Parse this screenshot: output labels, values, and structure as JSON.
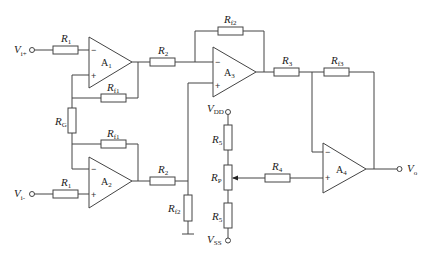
{
  "diagram": {
    "type": "circuit-schematic",
    "inputs": [
      {
        "id": "vin_plus",
        "main": "V",
        "sub": "i+"
      },
      {
        "id": "vin_minus",
        "main": "V",
        "sub": "i-"
      }
    ],
    "output": {
      "main": "V",
      "sub": "o"
    },
    "supplies": [
      {
        "id": "vdd",
        "main": "V",
        "sub": "DD"
      },
      {
        "id": "vss",
        "main": "V",
        "sub": "SS"
      }
    ],
    "amplifiers": [
      {
        "id": "A1",
        "main": "A",
        "sub": "1"
      },
      {
        "id": "A2",
        "main": "A",
        "sub": "2"
      },
      {
        "id": "A3",
        "main": "A",
        "sub": "3"
      },
      {
        "id": "A4",
        "main": "A",
        "sub": "4"
      }
    ],
    "resistors": {
      "r1_top": {
        "main": "R",
        "sub": "1"
      },
      "r1_bot": {
        "main": "R",
        "sub": "1"
      },
      "rf1_top": {
        "main": "R",
        "sub": "f1"
      },
      "rf1_bot": {
        "main": "R",
        "sub": "f1"
      },
      "rg": {
        "main": "R",
        "sub": "G"
      },
      "r2_top": {
        "main": "R",
        "sub": "2"
      },
      "r2_bot": {
        "main": "R",
        "sub": "2"
      },
      "rf2_top": {
        "main": "R",
        "sub": "f2"
      },
      "rf2_bot": {
        "main": "R",
        "sub": "f2"
      },
      "r3": {
        "main": "R",
        "sub": "3"
      },
      "rf3": {
        "main": "R",
        "sub": "f3"
      },
      "r4": {
        "main": "R",
        "sub": "4"
      },
      "r5_top": {
        "main": "R",
        "sub": "5"
      },
      "r5_bot": {
        "main": "R",
        "sub": "5"
      },
      "rp": {
        "main": "R",
        "sub": "P"
      }
    },
    "signs": {
      "minus": "−",
      "plus": "+"
    }
  }
}
